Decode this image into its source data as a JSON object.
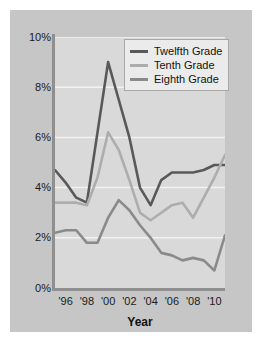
{
  "chart_data": {
    "type": "line",
    "title": "",
    "subtitle": "",
    "xlabel": "Year",
    "ylabel": "",
    "grid": true,
    "legend_position": "top-right",
    "xlim": [
      1995,
      2011
    ],
    "ylim": [
      0,
      10
    ],
    "x": [
      1995,
      1996,
      1997,
      1998,
      1999,
      2000,
      2001,
      2002,
      2003,
      2004,
      2005,
      2006,
      2007,
      2008,
      2009,
      2010,
      2011
    ],
    "xtick_labels": [
      "'96",
      "'98",
      "'00",
      "'02",
      "'04",
      "'06",
      "'08",
      "'10"
    ],
    "xtick_values": [
      1996,
      1998,
      2000,
      2002,
      2004,
      2006,
      2008,
      2010
    ],
    "ytick_labels": [
      "0%",
      "2%",
      "4%",
      "6%",
      "8%",
      "10%"
    ],
    "ytick_values": [
      0,
      2,
      4,
      6,
      8,
      10
    ],
    "series": [
      {
        "name": "Twelfth Grade",
        "color": "#595959",
        "values": [
          4.7,
          4.2,
          3.6,
          3.4,
          6.2,
          9.0,
          7.5,
          6.0,
          4.0,
          3.3,
          4.3,
          4.6,
          4.6,
          4.6,
          4.7,
          4.9,
          4.9
        ]
      },
      {
        "name": "Tenth Grade",
        "color": "#adadad",
        "values": [
          3.4,
          3.4,
          3.4,
          3.3,
          4.4,
          6.2,
          5.5,
          4.3,
          3.0,
          2.7,
          3.0,
          3.3,
          3.4,
          2.8,
          3.6,
          4.4,
          5.3
        ]
      },
      {
        "name": "Eighth Grade",
        "color": "#8a8a8a",
        "values": [
          2.2,
          2.3,
          2.3,
          1.8,
          1.8,
          2.8,
          3.5,
          3.1,
          2.5,
          2.0,
          1.4,
          1.3,
          1.1,
          1.2,
          1.1,
          0.7,
          2.1
        ]
      }
    ]
  },
  "legend": {
    "entries": [
      {
        "label": "Twelfth Grade"
      },
      {
        "label": "Tenth Grade"
      },
      {
        "label": "Eighth Grade"
      }
    ]
  },
  "colors": {
    "figure_background": "#ffffff",
    "panel_background": "#c6c6c6",
    "plot_background": "#d9d9d9",
    "gridline": "#f2f2f2",
    "axis_line": "#8f8f8f",
    "text": "#1a1a1a"
  }
}
